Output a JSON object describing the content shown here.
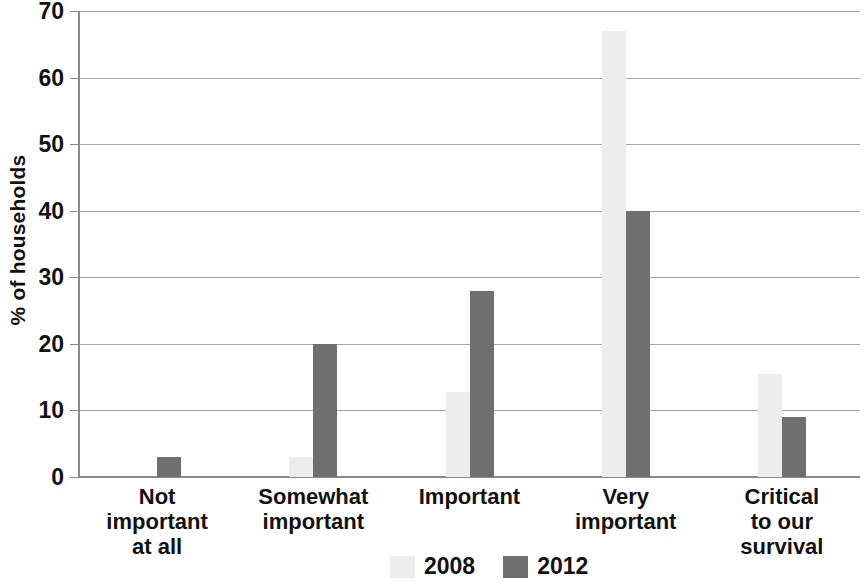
{
  "chart_data": {
    "type": "bar",
    "title": "",
    "subtitle": "",
    "xlabel": "",
    "ylabel": "% of households",
    "ylim": [
      0,
      70
    ],
    "ytick_step": 10,
    "yticks": [
      70,
      60,
      50,
      40,
      30,
      20,
      10,
      0
    ],
    "grid": "horizontal",
    "legend_position": "bottom-center",
    "categories": [
      "Not important at all",
      "Somewhat important",
      "Important",
      "Very important",
      "Critical to our survival"
    ],
    "category_label_lines": [
      [
        "Not",
        "important",
        "at all"
      ],
      [
        "Somewhat",
        "important"
      ],
      [
        "Important"
      ],
      [
        "Very",
        "important"
      ],
      [
        "Critical",
        "to our",
        "survival"
      ]
    ],
    "series": [
      {
        "name": "2008",
        "color": "#ededed",
        "values": [
          0,
          3,
          12.7,
          67,
          15.5
        ]
      },
      {
        "name": "2012",
        "color": "#6f6f6f",
        "values": [
          3,
          20,
          28,
          40,
          9
        ]
      }
    ]
  },
  "legend": {
    "items": [
      {
        "label": "2008",
        "swatch": "legend-swatch-2008"
      },
      {
        "label": "2012",
        "swatch": "legend-swatch-2012"
      }
    ]
  },
  "axis": {
    "y_title": "% of households"
  }
}
